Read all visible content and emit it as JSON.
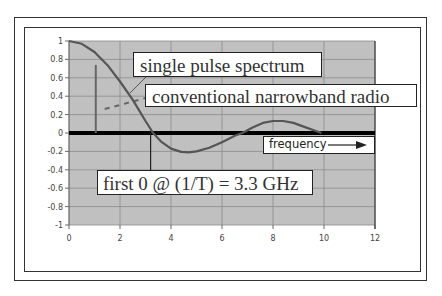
{
  "chart_data": {
    "type": "line",
    "title": "",
    "xlabel": "",
    "ylabel": "",
    "xlim": [
      0,
      12
    ],
    "ylim": [
      -1,
      1
    ],
    "x_ticks": [
      "0",
      "2",
      "4",
      "6",
      "8",
      "10",
      "12"
    ],
    "y_ticks": [
      "1",
      "0.8",
      "0.6",
      "0.4",
      "0.2",
      "0",
      "-0.2",
      "-0.4",
      "-0.6",
      "-0.8",
      "-1"
    ],
    "grid": true,
    "legend": "none",
    "series": [
      {
        "name": "single pulse spectrum",
        "x": [
          0,
          0.5,
          1,
          1.5,
          2,
          2.5,
          3,
          3.3,
          3.6,
          4,
          4.4,
          4.7,
          5,
          5.5,
          6,
          6.5,
          6.8,
          7.2,
          7.6,
          8,
          8.4,
          8.8,
          9.2,
          9.6,
          9.9
        ],
        "y": [
          1,
          0.97,
          0.88,
          0.74,
          0.56,
          0.36,
          0.13,
          0,
          -0.09,
          -0.17,
          -0.205,
          -0.21,
          -0.2,
          -0.16,
          -0.1,
          -0.03,
          0,
          0.06,
          0.11,
          0.13,
          0.13,
          0.11,
          0.07,
          0.03,
          0
        ]
      }
    ],
    "markers": [
      {
        "name": "narrowband radio carrier",
        "type": "vertical-bar",
        "x": 1.05,
        "y_top": 0.74
      },
      {
        "name": "narrowband radio dashed",
        "type": "dashed-line",
        "points": [
          [
            1.4,
            0.26
          ],
          [
            3.0,
            0.38
          ]
        ]
      },
      {
        "name": "first zero marker",
        "type": "vertical-line",
        "x": 3.2,
        "y_range": [
          0,
          -0.4
        ]
      }
    ],
    "annotations": [
      "single pulse spectrum",
      "conventional narrowband radio",
      "frequency→",
      "first 0 @ (1/T) = 3.3 GHz"
    ]
  },
  "labels": {
    "pulse": "single pulse spectrum",
    "narrowband": "conventional narrowband radio",
    "frequency": "frequency",
    "first_zero": "first 0 @ (1/T) = 3.3 GHz"
  },
  "colors": {
    "plot_bg": "#c0c0c0",
    "grid": "#8a8a8a",
    "curve": "#555555",
    "zero_line": "#000000"
  }
}
